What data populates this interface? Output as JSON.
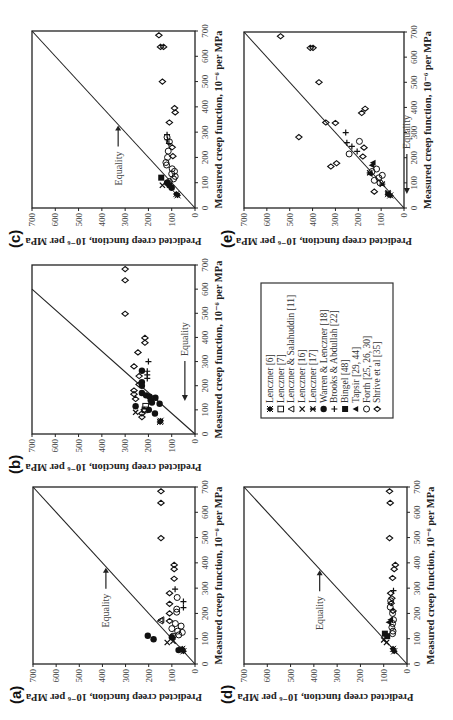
{
  "figure": {
    "rotation_deg": -90,
    "xlabel": "Measured creep function, 10⁻⁶ per MPa",
    "ylabel": "Predicted creep function, 10⁻⁶ per MPa",
    "annotation": "Equality",
    "ticks": [
      "0",
      "100",
      "200",
      "300",
      "400",
      "500",
      "600",
      "700"
    ]
  },
  "legend": {
    "items": [
      {
        "label": "Lenczner [6]",
        "marker": "filled-diamond-star"
      },
      {
        "label": "Lenczner [7]",
        "marker": "open-square"
      },
      {
        "label": "Lenczner & Salahuddin [11]",
        "marker": "open-triangle"
      },
      {
        "label": "Lenczner [16]",
        "marker": "x-cross"
      },
      {
        "label": "Lenczner [17]",
        "marker": "asterisk-cross"
      },
      {
        "label": "Warren & Lenczner [18]",
        "marker": "filled-circle"
      },
      {
        "label": "Brooks & Abdullah [22]",
        "marker": "plus"
      },
      {
        "label": "Bingel [48]",
        "marker": "filled-square"
      },
      {
        "label": "Tapsir [29, 44]",
        "marker": "filled-triangle"
      },
      {
        "label": "Forth [25, 26, 30]",
        "marker": "open-circle"
      },
      {
        "label": "Shrive et al [35]",
        "marker": "open-diamond"
      }
    ]
  },
  "chart_data": [
    {
      "panel": "(a)",
      "type": "scatter",
      "xlabel": "Measured creep function, 10⁻⁶ per MPa",
      "ylabel": "Predicted creep function, 10⁻⁶ per MPa",
      "xlim": [
        0,
        700
      ],
      "ylim": [
        0,
        700
      ],
      "reference_line": {
        "label": "Equality",
        "from": [
          0,
          0
        ],
        "to": [
          700,
          700
        ],
        "arrow_at": [
          385,
          385
        ]
      },
      "series": [
        {
          "name": "Shrive et al [35]",
          "marker": "open-diamond",
          "points": [
            [
              683,
              147
            ],
            [
              637,
              147
            ],
            [
              498,
              147
            ],
            [
              392,
              90
            ],
            [
              375,
              90
            ],
            [
              337,
              90
            ],
            [
              280,
              110
            ],
            [
              238,
              110
            ],
            [
              200,
              110
            ],
            [
              170,
              110
            ]
          ]
        },
        {
          "name": "Brooks & Abdullah [22]",
          "marker": "plus",
          "points": [
            [
              296,
              86
            ],
            [
              247,
              50
            ],
            [
              223,
              50
            ]
          ]
        },
        {
          "name": "Forth [25, 26, 30]",
          "marker": "open-circle",
          "points": [
            [
              263,
              77
            ],
            [
              217,
              79
            ],
            [
              205,
              79
            ],
            [
              160,
              85
            ],
            [
              150,
              60
            ],
            [
              140,
              100
            ],
            [
              130,
              75
            ],
            [
              125,
              55
            ],
            [
              115,
              70
            ],
            [
              110,
              95
            ]
          ]
        },
        {
          "name": "Lenczner & Salahuddin [11]",
          "marker": "open-triangle",
          "points": [
            [
              170,
              149
            ],
            [
              175,
              145
            ]
          ]
        },
        {
          "name": "Warren & Lenczner [18]",
          "marker": "filled-circle",
          "points": [
            [
              112,
              204
            ],
            [
              98,
              179
            ],
            [
              106,
              100
            ],
            [
              55,
              71
            ]
          ]
        },
        {
          "name": "Lenczner [16]",
          "marker": "x-cross",
          "points": [
            [
              90,
              95
            ],
            [
              85,
              120
            ]
          ]
        },
        {
          "name": "Lenczner [6]",
          "marker": "filled-diamond-star",
          "points": [
            [
              50,
              50
            ],
            [
              60,
              55
            ]
          ]
        }
      ]
    },
    {
      "panel": "(b)",
      "type": "scatter",
      "xlabel": "Measured creep function, 10⁻⁶ per MPa",
      "ylabel": "Predicted creep function, 10⁻⁶ per MPa",
      "xlim": [
        0,
        700
      ],
      "ylim": [
        0,
        700
      ],
      "reference_line": {
        "label": "Equality",
        "from": [
          0,
          0
        ],
        "to": [
          600,
          700
        ],
        "arrow_at": [
          120,
          95
        ]
      },
      "series": [
        {
          "name": "Shrive et al [35]",
          "marker": "open-diamond",
          "points": [
            [
              683,
              300
            ],
            [
              637,
              300
            ],
            [
              498,
              300
            ],
            [
              398,
              215
            ],
            [
              378,
              215
            ],
            [
              338,
              245
            ],
            [
              280,
              262
            ],
            [
              240,
              240
            ],
            [
              205,
              240
            ],
            [
              180,
              262
            ],
            [
              165,
              262
            ],
            [
              145,
              255
            ],
            [
              100,
              218
            ],
            [
              85,
              228
            ],
            [
              70,
              228
            ]
          ]
        },
        {
          "name": "Brooks & Abdullah [22]",
          "marker": "plus",
          "points": [
            [
              300,
              200
            ],
            [
              260,
              205
            ],
            [
              245,
              205
            ],
            [
              230,
              205
            ]
          ]
        },
        {
          "name": "Warren & Lenczner [18]",
          "marker": "filled-circle",
          "points": [
            [
              262,
              228
            ],
            [
              215,
              228
            ],
            [
              200,
              228
            ],
            [
              170,
              228
            ],
            [
              160,
              210
            ],
            [
              155,
              195
            ],
            [
              150,
              170
            ],
            [
              140,
              190
            ],
            [
              130,
              185
            ],
            [
              125,
              152
            ],
            [
              115,
              255
            ],
            [
              100,
              198
            ],
            [
              85,
              172
            ]
          ]
        },
        {
          "name": "Lenczner [7]",
          "marker": "open-square",
          "points": [
            [
              115,
              212
            ],
            [
              100,
              215
            ]
          ]
        },
        {
          "name": "Lenczner [16]",
          "marker": "x-cross",
          "points": [
            [
              90,
              255
            ]
          ]
        },
        {
          "name": "Lenczner [6]",
          "marker": "filled-diamond-star",
          "points": [
            [
              55,
              148
            ],
            [
              50,
              150
            ]
          ]
        }
      ]
    },
    {
      "panel": "(c)",
      "type": "scatter",
      "xlabel": "Measured creep function, 10⁻⁶ per MPa",
      "ylabel": "Predicted creep function, 10⁻⁶ per MPa",
      "xlim": [
        0,
        700
      ],
      "ylim": [
        0,
        700
      ],
      "reference_line": {
        "label": "Equality",
        "from": [
          0,
          0
        ],
        "to": [
          700,
          700
        ],
        "arrow_at": [
          330,
          330
        ]
      },
      "series": [
        {
          "name": "Shrive et al [35]",
          "marker": "open-diamond",
          "points": [
            [
              683,
              155
            ],
            [
              637,
              148
            ],
            [
              637,
              135
            ],
            [
              500,
              140
            ],
            [
              395,
              88
            ],
            [
              378,
              85
            ],
            [
              338,
              110
            ],
            [
              240,
              98
            ],
            [
              205,
              95
            ]
          ]
        },
        {
          "name": "Brooks & Abdullah [22]",
          "marker": "plus",
          "points": [
            [
              290,
              120
            ],
            [
              270,
              118
            ],
            [
              255,
              112
            ]
          ]
        },
        {
          "name": "Forth [25, 26, 30]",
          "marker": "open-circle",
          "points": [
            [
              280,
              120
            ],
            [
              262,
              110
            ],
            [
              225,
              115
            ],
            [
              200,
              118
            ],
            [
              180,
              125
            ],
            [
              170,
              122
            ],
            [
              155,
              98
            ],
            [
              145,
              88
            ],
            [
              135,
              100
            ],
            [
              125,
              85
            ],
            [
              115,
              92
            ],
            [
              105,
              110
            ]
          ]
        },
        {
          "name": "Bingel [48]",
          "marker": "filled-square",
          "points": [
            [
              120,
              145
            ]
          ]
        },
        {
          "name": "Warren & Lenczner [18]",
          "marker": "filled-circle",
          "points": [
            [
              100,
              120
            ],
            [
              90,
              110
            ],
            [
              80,
              100
            ]
          ]
        },
        {
          "name": "Lenczner [16]",
          "marker": "x-cross",
          "points": [
            [
              90,
              140
            ]
          ]
        },
        {
          "name": "Lenczner [6]",
          "marker": "filled-diamond-star",
          "points": [
            [
              55,
              80
            ],
            [
              50,
              75
            ]
          ]
        }
      ]
    },
    {
      "panel": "(d)",
      "type": "scatter",
      "xlabel": "Measured creep function, 10⁻⁶ per MPa",
      "ylabel": "Predicted creep function, 10⁻⁶ per MPa",
      "xlim": [
        0,
        700
      ],
      "ylim": [
        0,
        700
      ],
      "reference_line": {
        "label": "Equality",
        "from": [
          0,
          0
        ],
        "to": [
          700,
          700
        ],
        "arrow_at": [
          375,
          375
        ]
      },
      "series": [
        {
          "name": "Shrive et al [35]",
          "marker": "open-diamond",
          "points": [
            [
              683,
              75
            ],
            [
              637,
              72
            ],
            [
              498,
              75
            ],
            [
              392,
              50
            ],
            [
              375,
              55
            ],
            [
              340,
              62
            ],
            [
              280,
              70
            ],
            [
              260,
              65
            ],
            [
              240,
              68
            ],
            [
              210,
              60
            ]
          ]
        },
        {
          "name": "Brooks & Abdullah [22]",
          "marker": "plus",
          "points": [
            [
              290,
              58
            ]
          ]
        },
        {
          "name": "Forth [25, 26, 30]",
          "marker": "open-circle",
          "points": [
            [
              250,
              70
            ],
            [
              225,
              72
            ],
            [
              200,
              62
            ],
            [
              175,
              58
            ],
            [
              160,
              62
            ],
            [
              145,
              65
            ],
            [
              130,
              60
            ],
            [
              120,
              62
            ]
          ]
        },
        {
          "name": "Tapsir [29, 44]",
          "marker": "filled-triangle",
          "points": [
            [
              175,
              70
            ],
            [
              165,
              78
            ]
          ]
        },
        {
          "name": "Bingel [48]",
          "marker": "filled-square",
          "points": [
            [
              120,
              95
            ],
            [
              110,
              85
            ]
          ]
        },
        {
          "name": "Lenczner [16]",
          "marker": "x-cross",
          "points": [
            [
              95,
              100
            ],
            [
              85,
              88
            ]
          ]
        },
        {
          "name": "Lenczner [6]",
          "marker": "filled-diamond-star",
          "points": [
            [
              60,
              60
            ],
            [
              50,
              55
            ]
          ]
        }
      ]
    },
    {
      "panel": "(e)",
      "type": "scatter",
      "xlabel": "Measured creep function, 10⁻⁶ per MPa",
      "ylabel": "Predicted creep function, 10⁻⁶ per MPa",
      "xlim": [
        0,
        700
      ],
      "ylim": [
        0,
        700
      ],
      "reference_line": {
        "label": "Equality",
        "from": [
          0,
          0
        ],
        "to": [
          700,
          700
        ],
        "arrow_at": [
          40,
          40
        ]
      },
      "series": [
        {
          "name": "Shrive et al [35]",
          "marker": "open-diamond",
          "points": [
            [
              683,
              540
            ],
            [
              637,
              410
            ],
            [
              637,
              398
            ],
            [
              500,
              372
            ],
            [
              395,
              170
            ],
            [
              378,
              185
            ],
            [
              340,
              342
            ],
            [
              338,
              300
            ],
            [
              282,
              460
            ],
            [
              240,
              175
            ],
            [
              205,
              180
            ],
            [
              178,
              295
            ],
            [
              165,
              320
            ],
            [
              65,
              130
            ]
          ]
        },
        {
          "name": "Brooks & Abdullah [22]",
          "marker": "plus",
          "points": [
            [
              300,
              255
            ],
            [
              260,
              250
            ],
            [
              245,
              228
            ],
            [
              225,
              205
            ]
          ]
        },
        {
          "name": "Forth [25, 26, 30]",
          "marker": "open-circle",
          "points": [
            [
              265,
              195
            ],
            [
              215,
              240
            ],
            [
              155,
              120
            ],
            [
              145,
              140
            ],
            [
              130,
              95
            ],
            [
              120,
              110
            ],
            [
              110,
              130
            ],
            [
              100,
              105
            ]
          ]
        },
        {
          "name": "Tapsir [29, 44]",
          "marker": "filled-triangle",
          "points": [
            [
              180,
              135
            ],
            [
              170,
              140
            ],
            [
              135,
              148
            ]
          ]
        },
        {
          "name": "Lenczner [17]",
          "marker": "asterisk-cross",
          "points": [
            [
              140,
              150
            ],
            [
              95,
              95
            ],
            [
              60,
              70
            ]
          ]
        },
        {
          "name": "Lenczner [6]",
          "marker": "filled-diamond-star",
          "points": [
            [
              55,
              70
            ],
            [
              50,
              60
            ]
          ]
        }
      ]
    }
  ]
}
